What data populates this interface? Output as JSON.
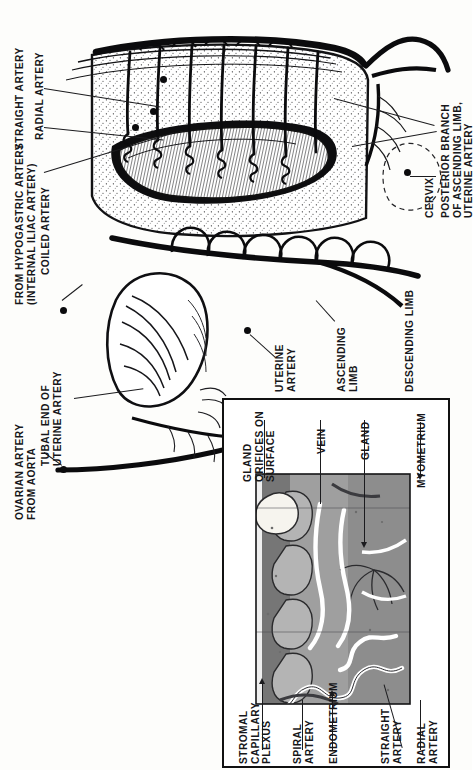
{
  "figure": {
    "domain": "anatomical-illustration",
    "orientation_note": "Entire plate is printed rotated 90°; all labels read bottom-to-top.",
    "colors": {
      "ink": "#17171a",
      "paper": "#fdfdfb",
      "panel_border": "#111111",
      "myometrium_gray": "#8d8d8d",
      "endometrium_gray": "#a9a9a9",
      "deep_gray": "#6e6e6e",
      "vessel_white": "#ffffff",
      "gland_light": "#f2f0ea"
    }
  },
  "main_labels": [
    {
      "id": "straight-artery",
      "text": "STRAIGHT ARTERY"
    },
    {
      "id": "radial-artery",
      "text": "RADIAL ARTERY"
    },
    {
      "id": "from-hypogastric",
      "text": "FROM HYPOGASTRIC ARTERY\n(INTERNAL ILIAC ARTERY)"
    },
    {
      "id": "coiled-artery",
      "text": "COILED ARTERY"
    },
    {
      "id": "ovarian-artery",
      "text": "OVARIAN ARTERY\nFROM AORTA"
    },
    {
      "id": "tubal-end",
      "text": "TUBAL END OF\nUTERINE ARTERY"
    },
    {
      "id": "uterine-artery",
      "text": "UTERINE\nARTERY"
    },
    {
      "id": "ascending-limb",
      "text": "ASCENDING\nLIMB"
    },
    {
      "id": "descending-limb",
      "text": "DESCENDING LIMB"
    },
    {
      "id": "cervix",
      "text": "CERVIX"
    },
    {
      "id": "posterior-branch",
      "text": "POSTERIOR BRANCH\nOF ASCENDING LIMB,\nUTERINE ARTERY"
    }
  ],
  "panel_labels_top": [
    {
      "id": "gland-orifices",
      "text": "GLAND\nORIFICES ON\nSURFACE"
    },
    {
      "id": "vein",
      "text": "VEIN"
    },
    {
      "id": "gland",
      "text": "GLAND"
    },
    {
      "id": "myometrium",
      "text": "MYOMETRIUM"
    }
  ],
  "panel_labels_bottom": [
    {
      "id": "stromal-plexus",
      "text": "STROMAL\nCAPILLARY\nPLEXUS"
    },
    {
      "id": "spiral-artery",
      "text": "SPIRAL\nARTERY"
    },
    {
      "id": "endometrium",
      "text": "ENDOMETRIUM"
    },
    {
      "id": "straight-artery-p",
      "text": "STRAIGHT\nARTERY"
    },
    {
      "id": "radial-artery-p",
      "text": "RADIAL\nARTERY"
    }
  ]
}
